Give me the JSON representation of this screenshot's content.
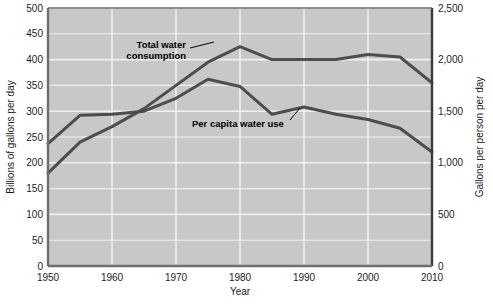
{
  "chart_data": {
    "type": "line",
    "title": "",
    "xlabel": "Year",
    "ylabel": "Billions of gallons per day",
    "y2label": "Gallons per person per day",
    "grid": true,
    "legend_position": "inline-annotations",
    "plot_background": "#c8c8c8",
    "line_color": "#4d4d4d",
    "xlim": [
      1950,
      2010
    ],
    "ylim": [
      0,
      500
    ],
    "y2lim": [
      0,
      2500
    ],
    "xticks": [
      1950,
      1960,
      1970,
      1980,
      1990,
      2000,
      2010
    ],
    "xticklabels": [
      "1950",
      "1960",
      "1970",
      "1980",
      "1990",
      "2000",
      "2010"
    ],
    "yticks": [
      0,
      50,
      100,
      150,
      200,
      250,
      300,
      350,
      400,
      450,
      500
    ],
    "yticklabels": [
      "0",
      "50",
      "100",
      "150",
      "200",
      "250",
      "300",
      "350",
      "400",
      "450",
      "500"
    ],
    "y2ticks": [
      0,
      500,
      1000,
      1500,
      2000,
      2500
    ],
    "y2ticklabels": [
      "0",
      "500",
      "1,000",
      "1,500",
      "2,000",
      "2,500"
    ],
    "x": [
      1950,
      1955,
      1960,
      1965,
      1970,
      1975,
      1980,
      1985,
      1990,
      1995,
      2000,
      2005,
      2010
    ],
    "series": [
      {
        "name": "Total water consumption",
        "axis": "left",
        "units": "Billions of gallons per day",
        "values": [
          180,
          240,
          270,
          305,
          350,
          395,
          425,
          400,
          400,
          400,
          410,
          405,
          355
        ]
      },
      {
        "name": "Per capita water use",
        "axis": "right",
        "units": "Gallons per person per day",
        "values": [
          1185,
          1460,
          1470,
          1500,
          1625,
          1810,
          1740,
          1470,
          1540,
          1470,
          1420,
          1335,
          1105
        ]
      }
    ],
    "annotations": [
      {
        "text_line1": "Total water",
        "text_line2": "consumption",
        "target_x": 1977,
        "target_y": 425
      },
      {
        "text_line1": "Per capita water use",
        "text_line2": "",
        "target_x": 1985,
        "target_y": 1470
      }
    ]
  }
}
